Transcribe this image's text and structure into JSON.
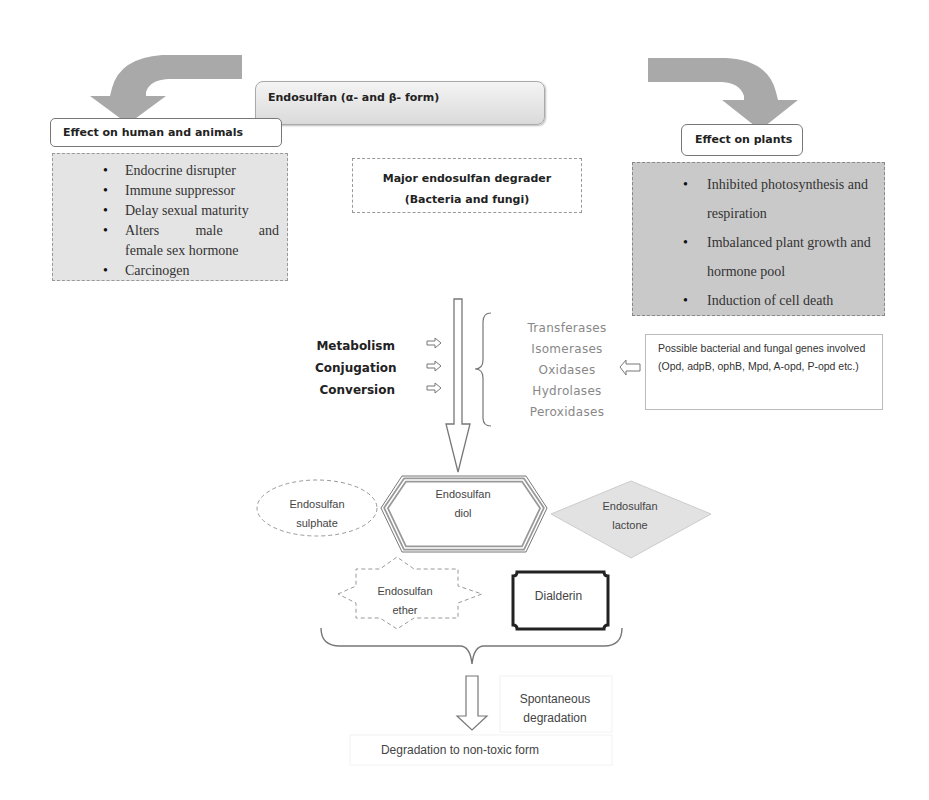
{
  "source": {
    "label": "Endosulfan (α- and β- form)"
  },
  "effects_human": {
    "header": "Effect on human and animals",
    "items": [
      "Endocrine disrupter",
      "Immune suppressor",
      "Delay sexual maturity",
      "Alters male and female sex hormone",
      "Carcinogen"
    ],
    "item_alters_line1_a": "Alters",
    "item_alters_line1_b": "male",
    "item_alters_line1_c": "and",
    "item_alters_line2": "female sex hormone"
  },
  "effects_plants": {
    "header": "Effect on plants",
    "items": [
      "Inhibited photosynthesis and respiration",
      "Imbalanced plant growth and hormone pool",
      "Induction of cell death"
    ]
  },
  "degrader": {
    "line1": "Major endosulfan degrader",
    "line2": "(Bacteria and fungi)"
  },
  "processes": [
    "Metabolism",
    "Conjugation",
    "Conversion"
  ],
  "enzymes": [
    "Transferases",
    "Isomerases",
    "Oxidases",
    "Hydrolases",
    "Peroxidases"
  ],
  "genes": {
    "text": "Possible bacterial and fungal genes involved (Opd, adpB, ophB, Mpd, A-opd, P-opd etc.)"
  },
  "metabolites": {
    "sulphate": {
      "line1": "Endosulfan",
      "line2": "sulphate"
    },
    "diol": {
      "line1": "Endosulfan",
      "line2": "diol"
    },
    "lactone": {
      "line1": "Endosulfan",
      "line2": "lactone"
    },
    "ether": {
      "line1": "Endosulfan",
      "line2": "ether"
    },
    "dialderin": {
      "label": "Dialderin"
    }
  },
  "spontaneous": {
    "line1": "Spontaneous",
    "line2": "degradation"
  },
  "final": {
    "label": "Degradation to non-toxic form"
  },
  "colors": {
    "arrow_gray": "#a9a9a9",
    "plants_box": "#c9c9c9",
    "human_box": "#e4e4e4",
    "enzyme_text": "#888888",
    "lactone_fill": "#e2e2e2"
  }
}
